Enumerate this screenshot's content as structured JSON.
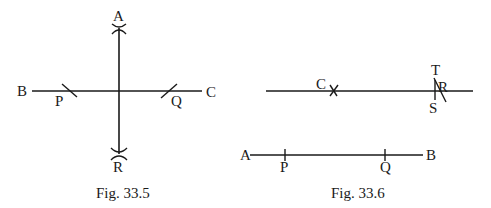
{
  "figures": [
    {
      "caption": "Fig. 33.5",
      "labels": {
        "A": "A",
        "B": "B",
        "C": "C",
        "P": "P",
        "Q": "Q",
        "R": "R"
      },
      "description": "Perpendicular bisector construction: horizontal line BC with arcs at P and Q, vertical line AR through midpoint with crossing arcs at A and R"
    },
    {
      "caption": "Fig. 33.6",
      "labels": {
        "C": "C",
        "T": "T",
        "R": "R",
        "S": "S",
        "A": "A",
        "P": "P",
        "Q": "Q",
        "B": "B"
      },
      "description": "Line segment AB with marks P and Q; parallel line above with point C marked by cross and arcs T, S intersecting at R"
    }
  ]
}
